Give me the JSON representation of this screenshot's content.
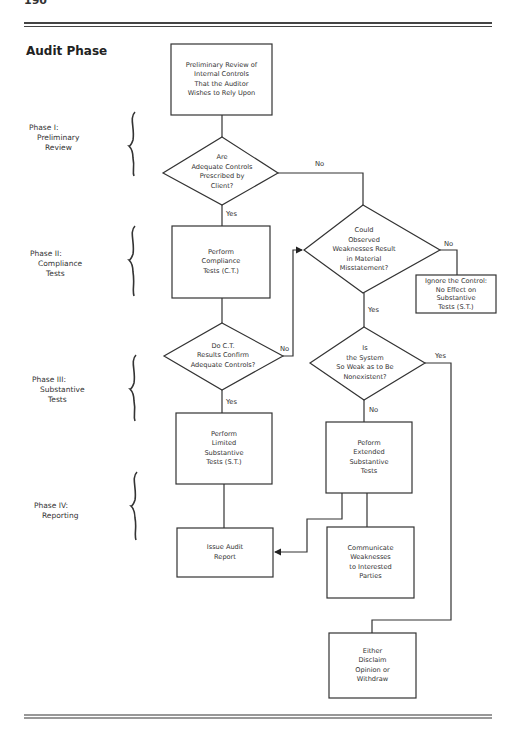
{
  "header": {
    "page_number": "190",
    "section_title": "Audit Phase"
  },
  "phases": [
    {
      "line1": "Phase I:",
      "line2": "Preliminary",
      "line3": "Review"
    },
    {
      "line1": "Phase II:",
      "line2": "Compliance",
      "line3": "Tests"
    },
    {
      "line1": "Phase III:",
      "line2": "Substantive",
      "line3": "Tests"
    },
    {
      "line1": "Phase IV:",
      "line2": "Reporting",
      "line3": ""
    }
  ],
  "nodes": {
    "start": "Preliminary Review of\nInternal Controls\nThat the Auditor\nWishes to Rely Upon",
    "q_adequate": "Are\nAdequate Controls\nPrescribed by\nClient?",
    "compliance": "Perform\nCompliance\nTests (C.T.)",
    "q_confirm": "Do C.T.\nResults Confirm\nAdequate Controls?",
    "limited": "Perform\nLimited\nSubstantive\nTests (S.T.)",
    "report": "Issue Audit\nReport",
    "q_weakness": "Could\nObserved\nWeaknesses Result\nin Material\nMisstatement?",
    "ignore": "Ignore the Control:\nNo Effect on\nSubstantive\nTests (S.T.)",
    "q_nonexistent": "Is\nthe System\nSo Weak as to Be\nNonexistent?",
    "extended": "Peform\nExtended\nSubstantive\nTests",
    "communicate": "Communicate\nWeaknesses\nto Interested\nParties",
    "disclaim": "Either\nDisclaim\nOpinion or\nWithdraw"
  },
  "edge_labels": {
    "adequate_yes": "Yes",
    "adequate_no": "No",
    "confirm_yes": "Yes",
    "confirm_no": "No",
    "weakness_yes": "Yes",
    "weakness_no": "No",
    "nonexistent_yes": "Yes",
    "nonexistent_no": "No"
  }
}
